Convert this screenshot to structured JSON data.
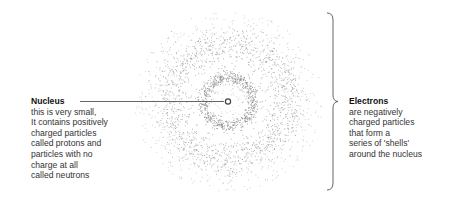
{
  "diagram": {
    "type": "atom-structure",
    "nucleus": {
      "title": "Nucleus",
      "lines": [
        "this is very small,",
        "It contains positively",
        "charged particles",
        "called protons and",
        "particles with no",
        "charge at all",
        "called neutrons"
      ]
    },
    "electrons": {
      "title": "Electrons",
      "lines": [
        "are negatively",
        "charged particles",
        "that form a",
        "series of 'shells'",
        "around the nucleus"
      ]
    },
    "colors": {
      "dots": "#8a8a8a",
      "line": "#555555",
      "text": "#333333"
    },
    "geometry": {
      "center": [
        228,
        101
      ],
      "inner_shell_radius": 25,
      "outer_shell_radius": 50,
      "cloud_radius": 95
    }
  }
}
